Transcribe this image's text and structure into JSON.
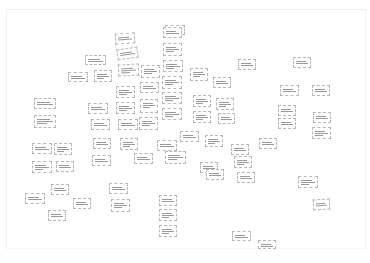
{
  "board": {
    "title": "Affinity diagram board",
    "note": "Card text is illegible at source resolution; labels are placeholders"
  },
  "cards": [
    {
      "id": 1,
      "x": 165,
      "y": 25,
      "w": 20,
      "h": 10,
      "r": 0,
      "label": "card"
    },
    {
      "id": 2,
      "x": 115,
      "y": 33,
      "w": 20,
      "h": 11,
      "r": -4,
      "label": "card"
    },
    {
      "id": 3,
      "x": 163,
      "y": 27,
      "w": 19,
      "h": 11,
      "r": 0,
      "label": "card"
    },
    {
      "id": 4,
      "x": 117,
      "y": 48,
      "w": 21,
      "h": 11,
      "r": -8,
      "label": "card"
    },
    {
      "id": 5,
      "x": 163,
      "y": 43,
      "w": 19,
      "h": 13,
      "r": 0,
      "label": "card"
    },
    {
      "id": 6,
      "x": 85,
      "y": 55,
      "w": 21,
      "h": 10,
      "r": 0,
      "label": "card"
    },
    {
      "id": 7,
      "x": 118,
      "y": 64,
      "w": 21,
      "h": 12,
      "r": -3,
      "label": "card"
    },
    {
      "id": 8,
      "x": 141,
      "y": 65,
      "w": 19,
      "h": 13,
      "r": 0,
      "label": "card"
    },
    {
      "id": 9,
      "x": 163,
      "y": 60,
      "w": 20,
      "h": 12,
      "r": 0,
      "label": "card"
    },
    {
      "id": 10,
      "x": 68,
      "y": 72,
      "w": 20,
      "h": 10,
      "r": 0,
      "label": "card"
    },
    {
      "id": 11,
      "x": 94,
      "y": 70,
      "w": 18,
      "h": 12,
      "r": 0,
      "label": "card"
    },
    {
      "id": 12,
      "x": 116,
      "y": 86,
      "w": 19,
      "h": 12,
      "r": 0,
      "label": "card"
    },
    {
      "id": 13,
      "x": 140,
      "y": 82,
      "w": 19,
      "h": 11,
      "r": 0,
      "label": "card"
    },
    {
      "id": 14,
      "x": 162,
      "y": 76,
      "w": 20,
      "h": 13,
      "r": 0,
      "label": "card"
    },
    {
      "id": 15,
      "x": 190,
      "y": 68,
      "w": 18,
      "h": 13,
      "r": 0,
      "label": "card"
    },
    {
      "id": 16,
      "x": 213,
      "y": 77,
      "w": 18,
      "h": 11,
      "r": 0,
      "label": "card"
    },
    {
      "id": 17,
      "x": 238,
      "y": 59,
      "w": 18,
      "h": 11,
      "r": 0,
      "label": "card"
    },
    {
      "id": 18,
      "x": 293,
      "y": 57,
      "w": 18,
      "h": 11,
      "r": 0,
      "label": "card"
    },
    {
      "id": 19,
      "x": 88,
      "y": 103,
      "w": 20,
      "h": 11,
      "r": 0,
      "label": "card"
    },
    {
      "id": 20,
      "x": 116,
      "y": 102,
      "w": 19,
      "h": 12,
      "r": 0,
      "label": "card"
    },
    {
      "id": 21,
      "x": 140,
      "y": 99,
      "w": 18,
      "h": 14,
      "r": 0,
      "label": "card"
    },
    {
      "id": 22,
      "x": 162,
      "y": 92,
      "w": 20,
      "h": 12,
      "r": 0,
      "label": "card"
    },
    {
      "id": 23,
      "x": 193,
      "y": 95,
      "w": 18,
      "h": 12,
      "r": 0,
      "label": "card"
    },
    {
      "id": 24,
      "x": 216,
      "y": 98,
      "w": 18,
      "h": 12,
      "r": 0,
      "label": "card"
    },
    {
      "id": 25,
      "x": 280,
      "y": 85,
      "w": 19,
      "h": 11,
      "r": 0,
      "label": "card"
    },
    {
      "id": 26,
      "x": 312,
      "y": 85,
      "w": 18,
      "h": 11,
      "r": 0,
      "label": "card"
    },
    {
      "id": 27,
      "x": 34,
      "y": 98,
      "w": 22,
      "h": 11,
      "r": 0,
      "label": "card"
    },
    {
      "id": 28,
      "x": 34,
      "y": 115,
      "w": 22,
      "h": 13,
      "r": 0,
      "label": "card"
    },
    {
      "id": 29,
      "x": 91,
      "y": 119,
      "w": 19,
      "h": 11,
      "r": 0,
      "label": "card"
    },
    {
      "id": 30,
      "x": 118,
      "y": 119,
      "w": 20,
      "h": 11,
      "r": 0,
      "label": "card"
    },
    {
      "id": 31,
      "x": 139,
      "y": 117,
      "w": 19,
      "h": 13,
      "r": 0,
      "label": "card"
    },
    {
      "id": 32,
      "x": 162,
      "y": 108,
      "w": 20,
      "h": 12,
      "r": 0,
      "label": "card"
    },
    {
      "id": 33,
      "x": 193,
      "y": 111,
      "w": 18,
      "h": 12,
      "r": 0,
      "label": "card"
    },
    {
      "id": 34,
      "x": 218,
      "y": 113,
      "w": 17,
      "h": 11,
      "r": 0,
      "label": "card"
    },
    {
      "id": 35,
      "x": 278,
      "y": 105,
      "w": 18,
      "h": 11,
      "r": 0,
      "label": "card"
    },
    {
      "id": 36,
      "x": 278,
      "y": 118,
      "w": 18,
      "h": 11,
      "r": 0,
      "label": "card"
    },
    {
      "id": 37,
      "x": 313,
      "y": 112,
      "w": 18,
      "h": 11,
      "r": 0,
      "label": "card"
    },
    {
      "id": 38,
      "x": 312,
      "y": 127,
      "w": 19,
      "h": 12,
      "r": 0,
      "label": "card"
    },
    {
      "id": 39,
      "x": 32,
      "y": 143,
      "w": 20,
      "h": 11,
      "r": 0,
      "label": "card"
    },
    {
      "id": 40,
      "x": 54,
      "y": 143,
      "w": 18,
      "h": 12,
      "r": 0,
      "label": "card"
    },
    {
      "id": 41,
      "x": 93,
      "y": 138,
      "w": 18,
      "h": 11,
      "r": 0,
      "label": "card"
    },
    {
      "id": 42,
      "x": 120,
      "y": 138,
      "w": 18,
      "h": 12,
      "r": 0,
      "label": "card"
    },
    {
      "id": 43,
      "x": 157,
      "y": 140,
      "w": 20,
      "h": 11,
      "r": 0,
      "label": "card"
    },
    {
      "id": 44,
      "x": 165,
      "y": 151,
      "w": 21,
      "h": 13,
      "r": 0,
      "label": "card"
    },
    {
      "id": 45,
      "x": 180,
      "y": 131,
      "w": 19,
      "h": 11,
      "r": 0,
      "label": "card"
    },
    {
      "id": 46,
      "x": 205,
      "y": 135,
      "w": 18,
      "h": 12,
      "r": 0,
      "label": "card"
    },
    {
      "id": 47,
      "x": 231,
      "y": 144,
      "w": 18,
      "h": 11,
      "r": 0,
      "label": "card"
    },
    {
      "id": 48,
      "x": 234,
      "y": 156,
      "w": 18,
      "h": 12,
      "r": 0,
      "label": "card"
    },
    {
      "id": 49,
      "x": 259,
      "y": 138,
      "w": 18,
      "h": 11,
      "r": 0,
      "label": "card"
    },
    {
      "id": 50,
      "x": 32,
      "y": 161,
      "w": 20,
      "h": 12,
      "r": 0,
      "label": "card"
    },
    {
      "id": 51,
      "x": 56,
      "y": 161,
      "w": 18,
      "h": 11,
      "r": 0,
      "label": "card"
    },
    {
      "id": 52,
      "x": 92,
      "y": 155,
      "w": 19,
      "h": 11,
      "r": 0,
      "label": "card"
    },
    {
      "id": 53,
      "x": 134,
      "y": 153,
      "w": 19,
      "h": 11,
      "r": 0,
      "label": "card"
    },
    {
      "id": 54,
      "x": 200,
      "y": 162,
      "w": 18,
      "h": 11,
      "r": 0,
      "label": "card"
    },
    {
      "id": 55,
      "x": 237,
      "y": 172,
      "w": 18,
      "h": 11,
      "r": 0,
      "label": "card"
    },
    {
      "id": 56,
      "x": 206,
      "y": 169,
      "w": 18,
      "h": 11,
      "r": 0,
      "label": "card"
    },
    {
      "id": 57,
      "x": 298,
      "y": 176,
      "w": 20,
      "h": 12,
      "r": 0,
      "label": "card"
    },
    {
      "id": 58,
      "x": 313,
      "y": 199,
      "w": 17,
      "h": 11,
      "r": -4,
      "label": "card"
    },
    {
      "id": 59,
      "x": 51,
      "y": 184,
      "w": 18,
      "h": 11,
      "r": 0,
      "label": "card"
    },
    {
      "id": 60,
      "x": 25,
      "y": 193,
      "w": 20,
      "h": 11,
      "r": 0,
      "label": "card"
    },
    {
      "id": 61,
      "x": 73,
      "y": 198,
      "w": 18,
      "h": 11,
      "r": 0,
      "label": "card"
    },
    {
      "id": 62,
      "x": 109,
      "y": 183,
      "w": 19,
      "h": 11,
      "r": 0,
      "label": "card"
    },
    {
      "id": 63,
      "x": 111,
      "y": 199,
      "w": 19,
      "h": 13,
      "r": 0,
      "label": "card"
    },
    {
      "id": 64,
      "x": 48,
      "y": 210,
      "w": 18,
      "h": 11,
      "r": 0,
      "label": "card"
    },
    {
      "id": 65,
      "x": 159,
      "y": 195,
      "w": 18,
      "h": 11,
      "r": 0,
      "label": "card"
    },
    {
      "id": 66,
      "x": 159,
      "y": 209,
      "w": 18,
      "h": 12,
      "r": 0,
      "label": "card"
    },
    {
      "id": 67,
      "x": 159,
      "y": 225,
      "w": 18,
      "h": 12,
      "r": 0,
      "label": "card"
    },
    {
      "id": 68,
      "x": 232,
      "y": 231,
      "w": 19,
      "h": 10,
      "r": 0,
      "label": "card"
    },
    {
      "id": 69,
      "x": 258,
      "y": 240,
      "w": 18,
      "h": 9,
      "r": 0,
      "label": "card"
    }
  ],
  "colors": {
    "background": "#ffffff",
    "card_border": "#b8b8b8",
    "text": "#333333"
  }
}
